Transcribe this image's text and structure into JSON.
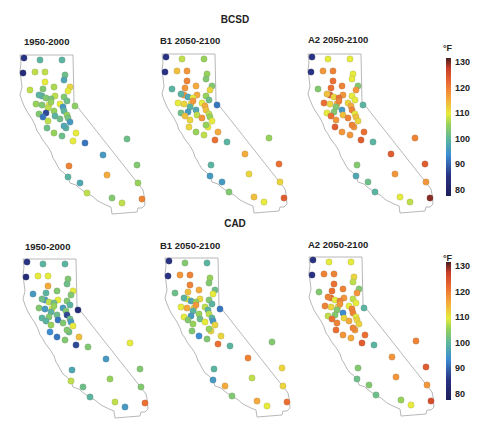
{
  "chart_data": [
    {
      "type": "scatter",
      "title": "BCSD",
      "subplots": [
        "1950-2000",
        "B1 2050-2100",
        "A2 2050-2100"
      ],
      "colorbar": {
        "label": "°F",
        "ticks": [
          80,
          90,
          100,
          110,
          120,
          130
        ],
        "range": [
          78,
          132
        ],
        "colormap": "jet-like (dark blue → cyan → green → yellow → orange → dark red)"
      },
      "description": "Station points on California outline colored by temperature (°F)"
    },
    {
      "type": "scatter",
      "title": "CAD",
      "subplots": [
        "1950-2000",
        "B1 2050-2100",
        "A2 2050-2100"
      ],
      "colorbar": {
        "label": "°F",
        "ticks": [
          80,
          90,
          100,
          110,
          120,
          130
        ],
        "range": [
          78,
          132
        ],
        "colormap": "jet-like (dark blue → cyan → green → yellow → orange → dark red)"
      },
      "description": "Station points on California outline colored by temperature (°F)"
    }
  ],
  "rows": [
    {
      "title": "BCSD",
      "panels": [
        {
          "label": "1950-2000",
          "values": [
            86,
            100,
            100,
            84,
            108,
            108,
            102,
            110,
            98,
            108,
            104,
            107,
            112,
            110,
            100,
            104,
            100,
            108,
            103,
            104,
            110,
            106,
            110,
            102,
            106,
            104,
            96,
            105,
            108,
            100,
            88,
            106,
            104,
            92,
            100,
            102,
            108,
            106,
            103,
            102,
            100,
            96,
            98,
            102,
            110,
            106,
            92,
            110,
            102,
            120,
            96,
            100,
            98,
            108,
            116,
            104,
            104,
            108,
            106,
            120
          ]
        },
        {
          "label": "B1 2050-2100",
          "values": [
            86,
            108,
            106,
            86,
            114,
            118,
            106,
            120,
            104,
            100,
            118,
            116,
            104,
            112,
            118,
            98,
            100,
            116,
            110,
            106,
            112,
            118,
            110,
            102,
            110,
            112,
            116,
            92,
            100,
            114,
            96,
            98,
            102,
            114,
            108,
            118,
            112,
            108,
            106,
            112,
            110,
            110,
            106,
            108,
            116,
            106,
            100,
            122,
            106,
            100,
            116,
            96,
            96,
            104,
            112,
            122,
            114,
            110,
            112,
            124
          ]
        },
        {
          "label": "A2 2050-2100",
          "values": [
            86,
            110,
            110,
            86,
            118,
            120,
            110,
            122,
            110,
            104,
            122,
            120,
            104,
            118,
            124,
            112,
            114,
            118,
            122,
            110,
            116,
            120,
            112,
            110,
            122,
            112,
            116,
            100,
            104,
            120,
            104,
            96,
            110,
            122,
            114,
            120,
            118,
            110,
            114,
            124,
            118,
            112,
            120,
            118,
            122,
            118,
            100,
            124,
            120,
            104,
            124,
            98,
            102,
            100,
            118,
            124,
            110,
            108,
            118,
            130
          ]
        }
      ]
    },
    {
      "title": "CAD",
      "panels": [
        {
          "label": "1950-2000",
          "values": [
            86,
            100,
            100,
            84,
            110,
            110,
            104,
            116,
            102,
            96,
            100,
            104,
            110,
            104,
            96,
            108,
            102,
            110,
            102,
            104,
            110,
            106,
            96,
            100,
            104,
            96,
            104,
            84,
            100,
            88,
            104,
            102,
            100,
            100,
            92,
            104,
            106,
            102,
            96,
            94,
            102,
            110,
            104,
            104,
            114,
            92,
            104,
            88,
            110,
            98,
            96,
            108,
            102,
            100,
            106,
            104,
            108,
            96,
            104,
            122
          ]
        },
        {
          "label": "B1 2050-2100",
          "values": [
            86,
            104,
            100,
            86,
            118,
            120,
            106,
            120,
            104,
            102,
            114,
            116,
            102,
            110,
            110,
            98,
            100,
            112,
            106,
            104,
            112,
            118,
            108,
            100,
            110,
            116,
            100,
            92,
            100,
            108,
            96,
            106,
            110,
            104,
            102,
            110,
            106,
            100,
            96,
            104,
            112,
            112,
            106,
            104,
            112,
            94,
            100,
            122,
            104,
            100,
            120,
            96,
            116,
            104,
            108,
            112,
            116,
            110,
            112,
            122
          ]
        },
        {
          "label": "A2 2050-2100",
          "values": [
            86,
            110,
            110,
            86,
            120,
            120,
            112,
            122,
            108,
            104,
            122,
            120,
            104,
            118,
            122,
            110,
            120,
            118,
            120,
            108,
            112,
            118,
            110,
            110,
            120,
            112,
            120,
            100,
            104,
            120,
            104,
            94,
            108,
            122,
            112,
            116,
            120,
            110,
            112,
            122,
            118,
            112,
            120,
            116,
            122,
            118,
            100,
            124,
            120,
            104,
            118,
            102,
            104,
            102,
            118,
            124,
            106,
            110,
            118,
            126
          ]
        }
      ]
    }
  ],
  "colorbar_unit": "°F",
  "colorbar_ticks": [
    "130",
    "120",
    "110",
    "100",
    "90",
    "80"
  ]
}
